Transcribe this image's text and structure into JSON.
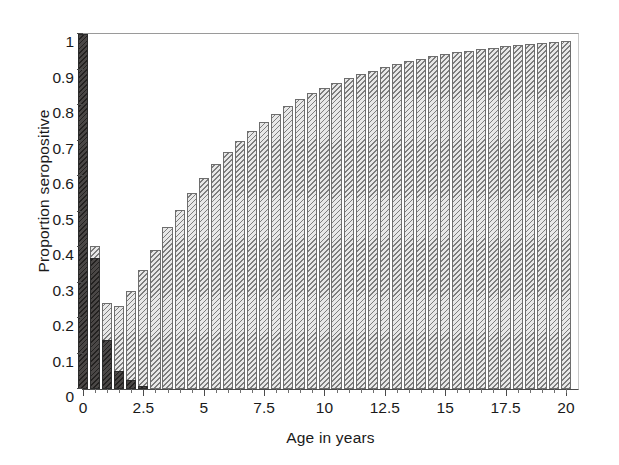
{
  "chart_data": {
    "type": "bar",
    "title": "",
    "subtitle": "",
    "xlabel": "Age in years",
    "ylabel": "Proportion seropositive",
    "xlim": [
      0,
      20.5
    ],
    "ylim": [
      0,
      1
    ],
    "grid": false,
    "legend": null,
    "xticks": [
      0,
      2.5,
      5,
      7.5,
      10,
      12.5,
      15,
      17.5,
      20
    ],
    "xticklabels": [
      "0",
      "2.5",
      "5",
      "7.5",
      "10",
      "12.5",
      "15",
      "17.5",
      "20"
    ],
    "xminorticks": [
      0.5,
      1,
      1.5,
      2,
      3,
      3.5,
      4,
      4.5,
      5.5,
      6,
      6.5,
      7,
      8,
      8.5,
      9,
      9.5,
      10.5,
      11,
      11.5,
      12,
      13,
      13.5,
      14,
      14.5,
      15.5,
      16,
      16.5,
      17,
      18,
      18.5,
      19,
      19.5,
      20
    ],
    "yticks": [
      0,
      0.1,
      0.2,
      0.3,
      0.4,
      0.5,
      0.6,
      0.7,
      0.8,
      0.9,
      1
    ],
    "yticklabels": [
      "0",
      "0.1",
      "0.2",
      "0.3",
      "0.4",
      "0.5",
      "0.6",
      "0.7",
      "0.8",
      "0.9",
      "1"
    ],
    "bar_width_years": 0.42,
    "series": [
      {
        "name": "hatched",
        "style": "diagonal-hatch",
        "color": "#e8e8e8",
        "x": [
          0.0,
          0.5,
          1.0,
          1.5,
          2.0,
          2.5,
          3.0,
          3.5,
          4.0,
          4.5,
          5.0,
          5.5,
          6.0,
          6.5,
          7.0,
          7.5,
          8.0,
          8.5,
          9.0,
          9.5,
          10.0,
          10.5,
          11.0,
          11.5,
          12.0,
          12.5,
          13.0,
          13.5,
          14.0,
          14.5,
          15.0,
          15.5,
          16.0,
          16.5,
          17.0,
          17.5,
          18.0,
          18.5,
          19.0,
          19.5,
          20.0
        ],
        "values": [
          1.0,
          0.402,
          0.241,
          0.235,
          0.277,
          0.335,
          0.391,
          0.455,
          0.504,
          0.551,
          0.594,
          0.633,
          0.667,
          0.7,
          0.727,
          0.753,
          0.776,
          0.797,
          0.816,
          0.833,
          0.849,
          0.863,
          0.875,
          0.887,
          0.897,
          0.907,
          0.915,
          0.923,
          0.93,
          0.937,
          0.943,
          0.948,
          0.953,
          0.957,
          0.962,
          0.965,
          0.969,
          0.972,
          0.975,
          0.978,
          0.98
        ]
      },
      {
        "name": "dark-overlay",
        "style": "solid-dark",
        "color": "#4a4746",
        "x": [
          0.0,
          0.5,
          1.0,
          1.5,
          2.0,
          2.5
        ],
        "values": [
          1.0,
          0.368,
          0.139,
          0.05,
          0.024,
          0.008
        ]
      }
    ]
  }
}
